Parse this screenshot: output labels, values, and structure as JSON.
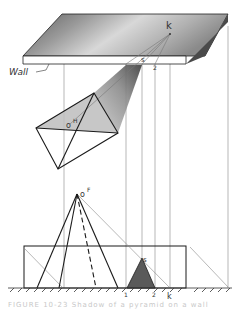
{
  "figure": {
    "type": "descriptive-geometry shadow construction",
    "labels": {
      "wall": "Wall",
      "k_top": "k",
      "s_top": "s",
      "two_top": "2",
      "o_plan": "o",
      "o_plan_sup": "H",
      "o_front": "o",
      "o_front_sup": "F",
      "s_front": "s",
      "one_front": "1",
      "two_front": "2",
      "k_front": "k"
    },
    "caption": "FIGURE 10-23  Shadow of a pyramid on a wall"
  },
  "colors": {
    "line": "#1a1a1a",
    "thin_line": "#777777",
    "shadow_dark": "#555555",
    "slab_light": "#e6e6e6",
    "slab_dark": "#6e6e6e"
  }
}
